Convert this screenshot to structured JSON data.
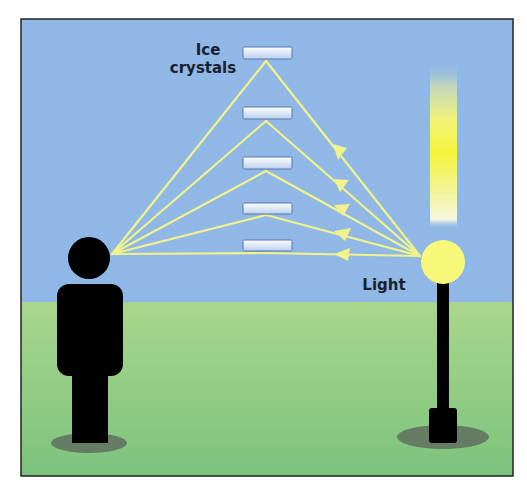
{
  "diagram": {
    "labels": {
      "ice_crystals_line1": "Ice",
      "ice_crystals_line2": "crystals",
      "light": "Light"
    },
    "colors": {
      "sky": "#8fb8e6",
      "ground_top": "#a9d68c",
      "ground_bottom": "#7bc37c",
      "frame": "#222222",
      "ray": "#f2f28a",
      "lamp_globe": "#f7f77a",
      "silhouette": "#000000",
      "shadow": "#5e6e5e",
      "crystal_fill_top": "#ffffff",
      "crystal_fill_bottom": "#b9d0ee",
      "crystal_border": "#5d74a8",
      "label_text": "#1a1f2e"
    },
    "icons": {
      "observer": "person-silhouette-icon",
      "lamp": "street-lamp-icon",
      "crystal": "ice-crystal-plate-icon",
      "light_pillar": "light-pillar-icon"
    },
    "crystals": [
      {
        "x": 243,
        "y": 47,
        "w": 49,
        "h": 12
      },
      {
        "x": 243,
        "y": 107,
        "w": 49,
        "h": 12
      },
      {
        "x": 243,
        "y": 157,
        "w": 49,
        "h": 12
      },
      {
        "x": 243,
        "y": 203,
        "w": 49,
        "h": 11
      },
      {
        "x": 243,
        "y": 240,
        "w": 49,
        "h": 11
      }
    ],
    "ray_paths": [
      {
        "apex_x": 266,
        "apex_y": 61,
        "arrow_x": 339,
        "arrow_y": 152
      },
      {
        "apex_x": 266,
        "apex_y": 121,
        "arrow_x": 341,
        "arrow_y": 185
      },
      {
        "apex_x": 266,
        "apex_y": 171,
        "arrow_x": 342,
        "arrow_y": 210
      },
      {
        "apex_x": 266,
        "apex_y": 215,
        "arrow_x": 343,
        "arrow_y": 234
      },
      {
        "apex_x": 266,
        "apex_y": 253,
        "arrow_x": 343,
        "arrow_y": 254
      }
    ],
    "eye_point": {
      "x": 112,
      "y": 254
    },
    "lamp_point": {
      "x": 420,
      "y": 256
    }
  }
}
